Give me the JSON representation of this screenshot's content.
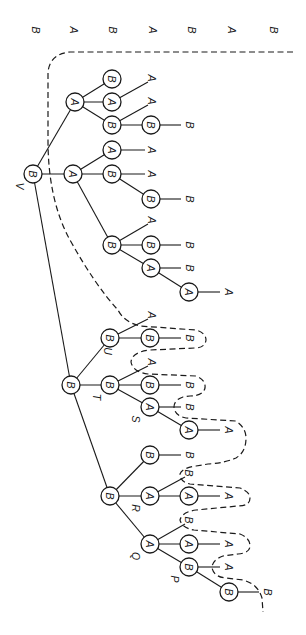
{
  "figure": {
    "orientation": "rotated 90 degrees clockwise (root at top-left, leaves to the right)",
    "top_row_labels": [
      {
        "x": 36,
        "text": "B"
      },
      {
        "x": 74,
        "text": "A"
      },
      {
        "x": 113,
        "text": "B"
      },
      {
        "x": 153,
        "text": "A"
      },
      {
        "x": 192,
        "text": "B"
      },
      {
        "x": 232,
        "text": "A"
      },
      {
        "x": 274,
        "text": "B"
      }
    ],
    "nodes": [
      {
        "id": "V",
        "x": 33,
        "y": 174,
        "text": "B",
        "tag": "V"
      },
      {
        "id": "n1",
        "x": 75,
        "y": 102,
        "text": "A"
      },
      {
        "id": "n2",
        "x": 112,
        "y": 79,
        "text": "B"
      },
      {
        "id": "n3",
        "x": 112,
        "y": 102,
        "text": "A"
      },
      {
        "id": "n4",
        "x": 112,
        "y": 125,
        "text": "B"
      },
      {
        "id": "n5",
        "x": 151,
        "y": 125,
        "text": "B"
      },
      {
        "id": "n6",
        "x": 73,
        "y": 174,
        "text": "A"
      },
      {
        "id": "n7",
        "x": 112,
        "y": 150,
        "text": "A"
      },
      {
        "id": "n8",
        "x": 112,
        "y": 174,
        "text": "B"
      },
      {
        "id": "n9",
        "x": 151,
        "y": 199,
        "text": "B"
      },
      {
        "id": "n10",
        "x": 112,
        "y": 245,
        "text": "B"
      },
      {
        "id": "n11",
        "x": 151,
        "y": 245,
        "text": "B"
      },
      {
        "id": "n12",
        "x": 151,
        "y": 268,
        "text": "A"
      },
      {
        "id": "n13",
        "x": 189,
        "y": 292,
        "text": "A"
      },
      {
        "id": "n14",
        "x": 71,
        "y": 385,
        "text": "B"
      },
      {
        "id": "U",
        "x": 110,
        "y": 338,
        "text": "B",
        "tag": "U"
      },
      {
        "id": "n15",
        "x": 150,
        "y": 338,
        "text": "B"
      },
      {
        "id": "T",
        "x": 110,
        "y": 385,
        "text": "B",
        "tag": "T"
      },
      {
        "id": "n16",
        "x": 150,
        "y": 385,
        "text": "B"
      },
      {
        "id": "S",
        "x": 150,
        "y": 407,
        "text": "A",
        "tag": "S"
      },
      {
        "id": "n17",
        "x": 189,
        "y": 430,
        "text": "A"
      },
      {
        "id": "n18",
        "x": 110,
        "y": 496,
        "text": "B"
      },
      {
        "id": "n19",
        "x": 150,
        "y": 455,
        "text": "B"
      },
      {
        "id": "R",
        "x": 150,
        "y": 496,
        "text": "A",
        "tag": "R"
      },
      {
        "id": "n20",
        "x": 189,
        "y": 496,
        "text": "A"
      },
      {
        "id": "Q",
        "x": 150,
        "y": 544,
        "text": "A",
        "tag": "Q"
      },
      {
        "id": "n21",
        "x": 189,
        "y": 544,
        "text": "A"
      },
      {
        "id": "P",
        "x": 189,
        "y": 567,
        "text": "B",
        "tag": "P"
      },
      {
        "id": "n22",
        "x": 229,
        "y": 592,
        "text": "B"
      }
    ],
    "leaves": [
      {
        "x": 152,
        "y": 78,
        "text": "A"
      },
      {
        "x": 152,
        "y": 101,
        "text": "A"
      },
      {
        "x": 190,
        "y": 125,
        "text": "B"
      },
      {
        "x": 152,
        "y": 150,
        "text": "A"
      },
      {
        "x": 152,
        "y": 174,
        "text": "A"
      },
      {
        "x": 190,
        "y": 199,
        "text": "B"
      },
      {
        "x": 152,
        "y": 220,
        "text": "A"
      },
      {
        "x": 190,
        "y": 245,
        "text": "B"
      },
      {
        "x": 190,
        "y": 268,
        "text": "B"
      },
      {
        "x": 229,
        "y": 292,
        "text": "A"
      },
      {
        "x": 152,
        "y": 315,
        "text": "A"
      },
      {
        "x": 190,
        "y": 338,
        "text": "B"
      },
      {
        "x": 152,
        "y": 362,
        "text": "A"
      },
      {
        "x": 190,
        "y": 385,
        "text": "B"
      },
      {
        "x": 190,
        "y": 407,
        "text": "B"
      },
      {
        "x": 229,
        "y": 430,
        "text": "A"
      },
      {
        "x": 190,
        "y": 455,
        "text": "B"
      },
      {
        "x": 189,
        "y": 473,
        "text": "B"
      },
      {
        "x": 229,
        "y": 496,
        "text": "A"
      },
      {
        "x": 189,
        "y": 520,
        "text": "B"
      },
      {
        "x": 229,
        "y": 544,
        "text": "A"
      },
      {
        "x": 229,
        "y": 567,
        "text": "A"
      },
      {
        "x": 268,
        "y": 592,
        "text": "B"
      }
    ],
    "edges": [
      [
        "V",
        "n1"
      ],
      [
        "V",
        "n6"
      ],
      [
        "V",
        "n14"
      ],
      [
        "n1",
        "n2"
      ],
      [
        "n1",
        "n3"
      ],
      [
        "n1",
        "n4"
      ],
      [
        "n4",
        "n5"
      ],
      [
        "n6",
        "n7"
      ],
      [
        "n6",
        "n8"
      ],
      [
        "n6",
        "n10"
      ],
      [
        "n8",
        "n9"
      ],
      [
        "n10",
        "n11"
      ],
      [
        "n10",
        "n12"
      ],
      [
        "n12",
        "n13"
      ],
      [
        "n14",
        "U"
      ],
      [
        "n14",
        "T"
      ],
      [
        "n14",
        "n18"
      ],
      [
        "U",
        "n15"
      ],
      [
        "T",
        "n16"
      ],
      [
        "T",
        "S"
      ],
      [
        "S",
        "n17"
      ],
      [
        "n18",
        "n19"
      ],
      [
        "n18",
        "R"
      ],
      [
        "n18",
        "Q"
      ],
      [
        "R",
        "n20"
      ],
      [
        "Q",
        "n21"
      ],
      [
        "Q",
        "P"
      ],
      [
        "P",
        "n22"
      ]
    ],
    "leaf_edges": [
      [
        "n3",
        152,
        78
      ],
      [
        "n4",
        152,
        101
      ],
      [
        "n5",
        181,
        125
      ],
      [
        "n7",
        145,
        150
      ],
      [
        "n8",
        145,
        174
      ],
      [
        "n9",
        181,
        199
      ],
      [
        "n10",
        152,
        220
      ],
      [
        "n11",
        181,
        245
      ],
      [
        "n12",
        181,
        268
      ],
      [
        "n13",
        220,
        292
      ],
      [
        "U",
        152,
        315
      ],
      [
        "n15",
        181,
        338
      ],
      [
        "T",
        152,
        362
      ],
      [
        "n16",
        181,
        385
      ],
      [
        "S",
        181,
        407
      ],
      [
        "n17",
        220,
        430
      ],
      [
        "n19",
        181,
        455
      ],
      [
        "R",
        189,
        473
      ],
      [
        "n20",
        220,
        496
      ],
      [
        "Q",
        189,
        520
      ],
      [
        "n21",
        220,
        544
      ],
      [
        "P",
        220,
        567
      ],
      [
        "n22",
        259,
        592
      ]
    ],
    "tag_offsets": {
      "V": [
        -13,
        12
      ],
      "U": [
        -2,
        13
      ],
      "T": [
        -13,
        12
      ],
      "S": [
        -14,
        12
      ],
      "R": [
        -14,
        12
      ],
      "Q": [
        -14,
        12
      ],
      "P": [
        -14,
        12
      ]
    }
  }
}
